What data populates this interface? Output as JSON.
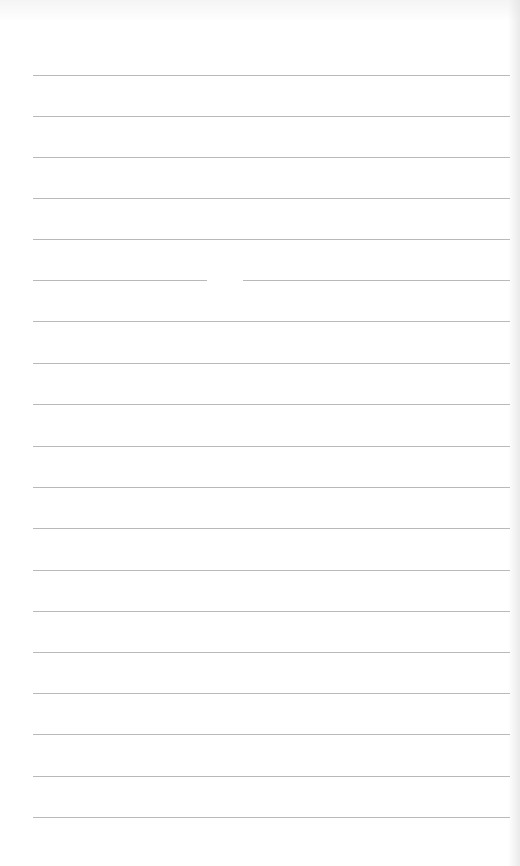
{
  "page": {
    "type": "lined-notepad",
    "background": "#ffffff",
    "line_color": "#b9b9b9",
    "line_left": 33,
    "line_right": 510,
    "lines_y": [
      75,
      116,
      157,
      198,
      239,
      280,
      321,
      363,
      404,
      446,
      487,
      528,
      570,
      611,
      652,
      693,
      734,
      776,
      817
    ],
    "gaps": [
      {
        "line_index": 5,
        "x_start": 207,
        "x_end": 243
      }
    ]
  }
}
